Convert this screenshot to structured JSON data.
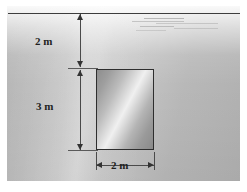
{
  "figure": {
    "name": "submerged-rectangular-gate-diagram",
    "colors": {
      "water_light": "#cfcfcf",
      "water_dark": "#b0b0b0",
      "surface_line": "#3d3d3d",
      "gate_outline": "#2e2e2e",
      "gate_light": "#f0f0f0",
      "gate_dark": "#8a8a8a",
      "dimension_line": "#4a4a4a",
      "label_text": "#1f1f1f"
    }
  },
  "surface": {
    "label": "water-surface-line"
  },
  "ripples": {
    "label": "water-ripple-streaks",
    "count": 6
  },
  "gate": {
    "label": "rectangular-gate"
  },
  "dimensions": {
    "depth_to_top": {
      "value": "2 m",
      "meaning": "depth from water surface to top edge of the gate",
      "orientation": "vertical"
    },
    "gate_height": {
      "value": "3 m",
      "meaning": "vertical height of the gate",
      "orientation": "vertical"
    },
    "gate_width": {
      "value": "2 m",
      "meaning": "horizontal width of the gate",
      "orientation": "horizontal"
    }
  }
}
